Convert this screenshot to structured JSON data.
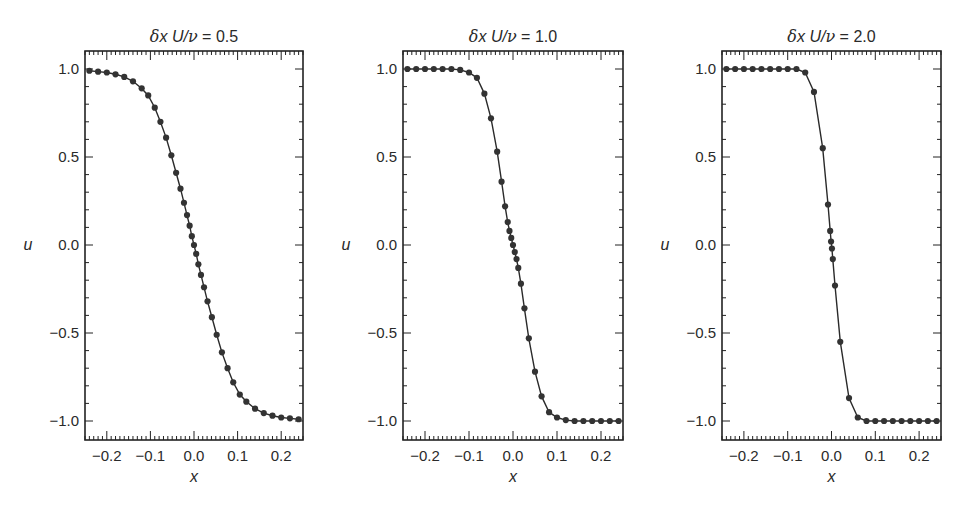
{
  "figure": {
    "panels": [
      {
        "title_prefix": "δx U/ν = ",
        "title_value": "0.5",
        "xlabel": "x",
        "ylabel": "u"
      },
      {
        "title_prefix": "δx U/ν = ",
        "title_value": "1.0",
        "xlabel": "x",
        "ylabel": "u"
      },
      {
        "title_prefix": "δx U/ν = ",
        "title_value": "2.0",
        "xlabel": "x",
        "ylabel": "u"
      }
    ],
    "line_color": "#2a2a2a",
    "marker_color": "#333333"
  },
  "chart_data": [
    {
      "type": "line",
      "title": "δx U/ν = 0.5",
      "xlabel": "x",
      "ylabel": "u",
      "xlim": [
        -0.25,
        0.25
      ],
      "ylim": [
        -1.1,
        1.1
      ],
      "xticks": [
        -0.2,
        -0.1,
        0.0,
        0.1,
        0.2
      ],
      "xtick_labels": [
        "−0.2",
        "−0.1",
        "0.0",
        "0.1",
        "0.2"
      ],
      "yticks": [
        -1.0,
        -0.5,
        0.0,
        0.5,
        1.0
      ],
      "ytick_labels": [
        "−1.0",
        "−0.5",
        "0.0",
        "0.5",
        "1.0"
      ],
      "grid": false,
      "markers": true,
      "series": [
        {
          "name": "u(x)",
          "x": [
            -0.24,
            -0.22,
            -0.2,
            -0.18,
            -0.16,
            -0.14,
            -0.12,
            -0.105,
            -0.09,
            -0.077,
            -0.064,
            -0.052,
            -0.041,
            -0.031,
            -0.023,
            -0.016,
            -0.01,
            -0.005,
            0.0,
            0.005,
            0.01,
            0.016,
            0.023,
            0.031,
            0.041,
            0.052,
            0.064,
            0.077,
            0.09,
            0.105,
            0.12,
            0.14,
            0.16,
            0.18,
            0.2,
            0.22,
            0.24
          ],
          "y": [
            0.99,
            0.985,
            0.98,
            0.97,
            0.955,
            0.93,
            0.89,
            0.85,
            0.78,
            0.7,
            0.61,
            0.51,
            0.41,
            0.32,
            0.24,
            0.17,
            0.11,
            0.05,
            0.0,
            -0.05,
            -0.11,
            -0.17,
            -0.24,
            -0.32,
            -0.41,
            -0.51,
            -0.61,
            -0.7,
            -0.78,
            -0.85,
            -0.89,
            -0.93,
            -0.955,
            -0.97,
            -0.98,
            -0.985,
            -0.99
          ]
        }
      ]
    },
    {
      "type": "line",
      "title": "δx U/ν = 1.0",
      "xlabel": "x",
      "ylabel": "u",
      "xlim": [
        -0.25,
        0.25
      ],
      "ylim": [
        -1.1,
        1.1
      ],
      "xticks": [
        -0.2,
        -0.1,
        0.0,
        0.1,
        0.2
      ],
      "xtick_labels": [
        "−0.2",
        "−0.1",
        "0.0",
        "0.1",
        "0.2"
      ],
      "yticks": [
        -1.0,
        -0.5,
        0.0,
        0.5,
        1.0
      ],
      "ytick_labels": [
        "−1.0",
        "−0.5",
        "0.0",
        "0.5",
        "1.0"
      ],
      "grid": false,
      "markers": true,
      "series": [
        {
          "name": "u(x)",
          "x": [
            -0.24,
            -0.22,
            -0.2,
            -0.18,
            -0.16,
            -0.14,
            -0.12,
            -0.1,
            -0.082,
            -0.065,
            -0.05,
            -0.036,
            -0.026,
            -0.018,
            -0.012,
            -0.008,
            -0.004,
            0.0,
            0.004,
            0.008,
            0.012,
            0.018,
            0.026,
            0.036,
            0.05,
            0.065,
            0.082,
            0.1,
            0.12,
            0.14,
            0.16,
            0.18,
            0.2,
            0.22,
            0.24
          ],
          "y": [
            1.0,
            1.0,
            1.0,
            1.0,
            1.0,
            1.0,
            0.995,
            0.98,
            0.95,
            0.86,
            0.72,
            0.53,
            0.36,
            0.22,
            0.13,
            0.08,
            0.04,
            0.0,
            -0.04,
            -0.08,
            -0.13,
            -0.22,
            -0.36,
            -0.53,
            -0.72,
            -0.86,
            -0.95,
            -0.98,
            -0.995,
            -1.0,
            -1.0,
            -1.0,
            -1.0,
            -1.0,
            -1.0
          ]
        }
      ]
    },
    {
      "type": "line",
      "title": "δx U/ν = 2.0",
      "xlabel": "x",
      "ylabel": "u",
      "xlim": [
        -0.25,
        0.25
      ],
      "ylim": [
        -1.1,
        1.1
      ],
      "xticks": [
        -0.2,
        -0.1,
        0.0,
        0.1,
        0.2
      ],
      "xtick_labels": [
        "−0.2",
        "−0.1",
        "0.0",
        "0.1",
        "0.2"
      ],
      "yticks": [
        -1.0,
        -0.5,
        0.0,
        0.5,
        1.0
      ],
      "ytick_labels": [
        "−1.0",
        "−0.5",
        "0.0",
        "0.5",
        "1.0"
      ],
      "grid": false,
      "markers": true,
      "series": [
        {
          "name": "u(x)",
          "x": [
            -0.24,
            -0.22,
            -0.2,
            -0.18,
            -0.16,
            -0.14,
            -0.12,
            -0.1,
            -0.08,
            -0.06,
            -0.04,
            -0.02,
            -0.008,
            -0.003,
            -0.001,
            0.001,
            0.003,
            0.008,
            0.02,
            0.04,
            0.06,
            0.08,
            0.1,
            0.12,
            0.14,
            0.16,
            0.18,
            0.2,
            0.22,
            0.24
          ],
          "y": [
            1.0,
            1.0,
            1.0,
            1.0,
            1.0,
            1.0,
            1.0,
            1.0,
            1.0,
            0.98,
            0.87,
            0.55,
            0.23,
            0.08,
            0.02,
            -0.02,
            -0.08,
            -0.23,
            -0.55,
            -0.87,
            -0.98,
            -1.0,
            -1.0,
            -1.0,
            -1.0,
            -1.0,
            -1.0,
            -1.0,
            -1.0,
            -1.0
          ]
        }
      ]
    }
  ]
}
